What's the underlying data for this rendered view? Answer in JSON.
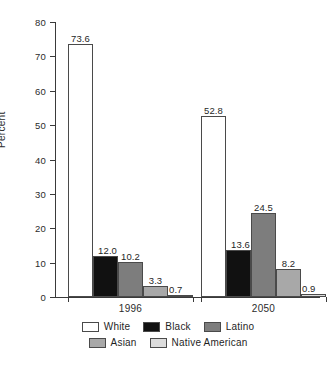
{
  "chart_data": {
    "type": "bar",
    "title": "",
    "xlabel": "",
    "ylabel": "Percent",
    "ylim": [
      0,
      80
    ],
    "yticks": [
      0,
      10,
      20,
      30,
      40,
      50,
      60,
      70,
      80
    ],
    "ytick_labels": [
      "0",
      "10",
      "20",
      "30",
      "40",
      "50",
      "60",
      "70",
      "80"
    ],
    "grid": false,
    "legend_position": "bottom",
    "categories": [
      "1996",
      "2050"
    ],
    "series": [
      {
        "name": "White",
        "values": [
          73.6,
          52.8
        ],
        "labels": [
          "73.6",
          "52.8"
        ],
        "color": "#ffffff"
      },
      {
        "name": "Black",
        "values": [
          12.0,
          13.6
        ],
        "labels": [
          "12.0",
          "13.6"
        ],
        "color": "#111111"
      },
      {
        "name": "Latino",
        "values": [
          10.2,
          24.5
        ],
        "labels": [
          "10.2",
          "24.5"
        ],
        "color": "#7d7d7d"
      },
      {
        "name": "Asian",
        "values": [
          3.3,
          8.2
        ],
        "labels": [
          "3.3",
          "8.2"
        ],
        "color": "#a8a8a8"
      },
      {
        "name": "Native American",
        "values": [
          0.7,
          0.9
        ],
        "labels": [
          "0.7",
          "0.9"
        ],
        "color": "#dcdcdc"
      }
    ]
  },
  "axis": {
    "ylabel": "Percent",
    "ytick_labels": [
      "80",
      "70",
      "60",
      "50",
      "40",
      "30",
      "20",
      "10",
      "0"
    ],
    "category_labels": [
      "1996",
      "2050"
    ]
  },
  "legend": {
    "row1": [
      {
        "label": "White",
        "color": "#ffffff"
      },
      {
        "label": "Black",
        "color": "#111111"
      },
      {
        "label": "Latino",
        "color": "#7d7d7d"
      }
    ],
    "row2": [
      {
        "label": "Asian",
        "color": "#a8a8a8"
      },
      {
        "label": "Native American",
        "color": "#dcdcdc"
      }
    ]
  }
}
